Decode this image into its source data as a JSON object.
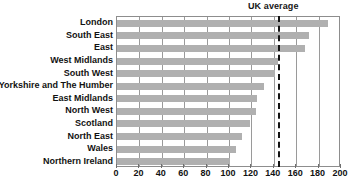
{
  "chart_data": {
    "type": "bar",
    "orientation": "horizontal",
    "title": "",
    "xlabel": "",
    "ylabel": "",
    "xlim": [
      0,
      200
    ],
    "xticks": [
      0,
      20,
      40,
      60,
      80,
      100,
      120,
      140,
      160,
      180,
      200
    ],
    "grid": "vertical",
    "legend": "none",
    "bar_color": "#b0b0b0",
    "categories": [
      "London",
      "South East",
      "East",
      "West Midlands",
      "South West",
      "Yorkshire and The Humber",
      "East Midlands",
      "North West",
      "Scotland",
      "North East",
      "Wales",
      "Northern Ireland"
    ],
    "values": [
      188,
      171,
      168,
      144,
      141,
      131,
      125,
      124,
      119,
      112,
      106,
      101
    ],
    "annotations": [
      {
        "name": "uk-average",
        "label": "UK average",
        "value": 144,
        "style": "dashed-vertical-line",
        "color": "#141414"
      }
    ]
  }
}
